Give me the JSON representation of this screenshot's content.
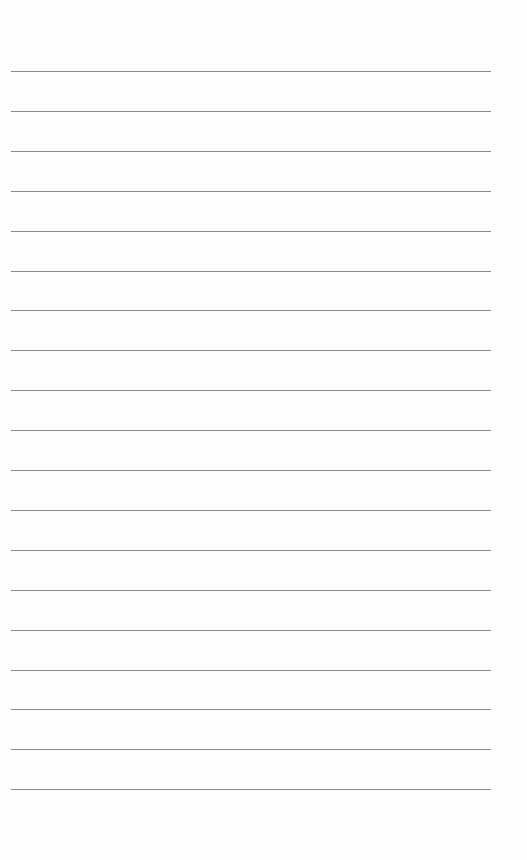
{
  "page": {
    "type": "lined-paper",
    "line_count": 19,
    "first_line_y": 71,
    "line_spacing": 39.9,
    "line_color": "#8a8a8a",
    "background": "#fefefe"
  }
}
